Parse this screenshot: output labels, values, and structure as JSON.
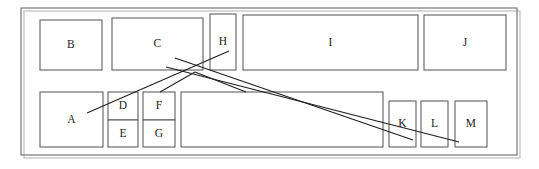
{
  "diagram": {
    "type": "region-segmentation",
    "canvas": {
      "width": 539,
      "height": 169
    },
    "colors": {
      "background": "#ffffff",
      "frame_stroke": "#6a6a6a",
      "frame_shadow": "#b9b9b9",
      "region_stroke": "#585858",
      "connector_stroke": "#1d1d1d",
      "label_color": "#1a1a1a"
    },
    "page_frame": {
      "label": "page-boundary",
      "x": 21,
      "y": 8,
      "width": 496,
      "height": 147
    },
    "page_frame_shadow": {
      "label": "page-boundary-shadow",
      "x": 24,
      "y": 11,
      "width": 496,
      "height": 147
    },
    "regions": [
      {
        "id": "B",
        "label": "B",
        "x": 40,
        "y": 20,
        "width": 62,
        "height": 50
      },
      {
        "id": "C",
        "label": "C",
        "x": 112,
        "y": 18,
        "width": 91,
        "height": 52
      },
      {
        "id": "H",
        "label": "H",
        "x": 210,
        "y": 14,
        "width": 26,
        "height": 56
      },
      {
        "id": "I",
        "label": "I",
        "x": 243,
        "y": 15,
        "width": 175,
        "height": 55
      },
      {
        "id": "J",
        "label": "J",
        "x": 424,
        "y": 15,
        "width": 82,
        "height": 55
      },
      {
        "id": "A",
        "label": "A",
        "x": 40,
        "y": 92,
        "width": 63,
        "height": 55
      },
      {
        "id": "D",
        "label": "D",
        "x": 108,
        "y": 92,
        "width": 30,
        "height": 28
      },
      {
        "id": "E",
        "label": "E",
        "x": 108,
        "y": 120,
        "width": 30,
        "height": 27
      },
      {
        "id": "F",
        "label": "F",
        "x": 143,
        "y": 92,
        "width": 32,
        "height": 28
      },
      {
        "id": "G",
        "label": "G",
        "x": 143,
        "y": 120,
        "width": 32,
        "height": 27
      },
      {
        "id": "",
        "label": "",
        "x": 181,
        "y": 92,
        "width": 202,
        "height": 55
      },
      {
        "id": "K",
        "label": "K",
        "x": 389,
        "y": 101,
        "width": 27,
        "height": 46
      },
      {
        "id": "L",
        "label": "L",
        "x": 421,
        "y": 101,
        "width": 27,
        "height": 46
      },
      {
        "id": "M",
        "label": "M",
        "x": 455,
        "y": 101,
        "width": 32,
        "height": 46
      }
    ],
    "connectors": [
      {
        "id": "conn-1",
        "label": "connector-a-to-upper-right",
        "x1": 87,
        "y1": 113,
        "x2": 229,
        "y2": 51
      },
      {
        "id": "conn-2",
        "label": "connector-c-to-k",
        "x1": 175,
        "y1": 58,
        "x2": 413,
        "y2": 140
      },
      {
        "id": "conn-3",
        "label": "connector-junction-to-l",
        "x1": 166,
        "y1": 67,
        "x2": 459,
        "y2": 142
      },
      {
        "id": "conn-4",
        "label": "connector-junction-down-left",
        "x1": 195,
        "y1": 72,
        "x2": 160,
        "y2": 92
      },
      {
        "id": "conn-5",
        "label": "connector-junction-down-right",
        "x1": 195,
        "y1": 72,
        "x2": 246,
        "y2": 92
      }
    ]
  }
}
